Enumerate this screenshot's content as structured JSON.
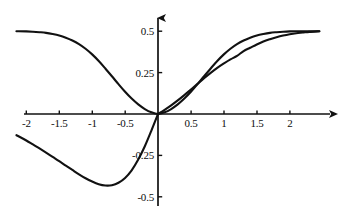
{
  "chart_data": {
    "type": "line",
    "title": "",
    "subtitle": "",
    "xlabel": "",
    "ylabel": "",
    "xlim": [
      -2.15,
      2.45
    ],
    "ylim": [
      -0.55,
      0.58
    ],
    "grid": false,
    "legend": "none",
    "background_color": "#ffffff",
    "line_color": "#111111",
    "axis_color": "#111111",
    "x_ticks": [
      {
        "value": -2,
        "label": "-2"
      },
      {
        "value": -1.5,
        "label": "-1.5"
      },
      {
        "value": -1,
        "label": "-1"
      },
      {
        "value": -0.5,
        "label": "-0.5"
      },
      {
        "value": 0.5,
        "label": "0.5"
      },
      {
        "value": 1,
        "label": "1"
      },
      {
        "value": 1.5,
        "label": "1.5"
      },
      {
        "value": 2,
        "label": "2"
      }
    ],
    "y_ticks": [
      {
        "value": 0.5,
        "label": "0.5"
      },
      {
        "value": 0.25,
        "label": "0.25"
      },
      {
        "value": -0.25,
        "label": "-0.25"
      },
      {
        "value": -0.5,
        "label": "-0.5"
      }
    ],
    "annotations": [
      {
        "name": "peak",
        "x": 0.72,
        "y": 0.43
      },
      {
        "name": "trough",
        "x": -0.72,
        "y": -0.43
      },
      {
        "name": "crossing",
        "x": 1.07,
        "y": 0.3
      },
      {
        "name": "origin",
        "x": 0,
        "y": 0
      }
    ],
    "series": [
      {
        "name": "decaying-bell-branch",
        "description": "Even bell-shaped curve at 0.5 on the far left, falling monotonically to 0 at the origin and decaying back toward 0 on the right.",
        "x": [
          -2.15,
          -2.0,
          -1.9,
          -1.8,
          -1.7,
          -1.6,
          -1.5,
          -1.4,
          -1.3,
          -1.2,
          -1.1,
          -1.0,
          -0.9,
          -0.8,
          -0.7,
          -0.6,
          -0.5,
          -0.4,
          -0.3,
          -0.2,
          -0.1,
          0.0,
          0.1,
          0.2,
          0.3,
          0.4,
          0.5,
          0.6,
          0.7,
          0.8,
          0.9,
          1.0,
          1.1,
          1.2,
          1.3,
          1.4,
          1.5,
          1.6,
          1.7,
          1.8,
          1.9,
          2.0,
          2.1,
          2.2,
          2.3,
          2.45
        ],
        "y": [
          0.5,
          0.499,
          0.497,
          0.494,
          0.49,
          0.483,
          0.474,
          0.461,
          0.444,
          0.422,
          0.394,
          0.36,
          0.32,
          0.275,
          0.228,
          0.18,
          0.134,
          0.093,
          0.058,
          0.03,
          0.01,
          0.0,
          0.01,
          0.03,
          0.058,
          0.093,
          0.134,
          0.18,
          0.228,
          0.275,
          0.32,
          0.36,
          0.394,
          0.422,
          0.444,
          0.461,
          0.474,
          0.483,
          0.49,
          0.494,
          0.497,
          0.499,
          0.5,
          0.5,
          0.5,
          0.5
        ]
      },
      {
        "name": "rising-sigmoid",
        "description": "Odd monotonic S-curve through the origin, saturating at +0.5 on the right.",
        "x": [
          0.0,
          0.1,
          0.2,
          0.3,
          0.4,
          0.5,
          0.6,
          0.7,
          0.8,
          0.9,
          1.0,
          1.1,
          1.2,
          1.3,
          1.4,
          1.5,
          1.6,
          1.7,
          1.8,
          1.9,
          2.0,
          2.1,
          2.2,
          2.3,
          2.45
        ],
        "y": [
          0.0,
          0.025,
          0.052,
          0.082,
          0.114,
          0.148,
          0.182,
          0.216,
          0.248,
          0.278,
          0.305,
          0.33,
          0.351,
          0.38,
          0.4,
          0.42,
          0.438,
          0.452,
          0.464,
          0.474,
          0.482,
          0.488,
          0.492,
          0.496,
          0.5
        ]
      },
      {
        "name": "negative-lobe",
        "description": "Odd companion branch on the left: dips to a minimum near x = -0.72 then returns to the origin.",
        "x": [
          -2.15,
          -2.0,
          -1.9,
          -1.8,
          -1.7,
          -1.6,
          -1.5,
          -1.4,
          -1.3,
          -1.2,
          -1.1,
          -1.0,
          -0.9,
          -0.8,
          -0.7,
          -0.6,
          -0.5,
          -0.4,
          -0.3,
          -0.2,
          -0.1,
          0.0
        ],
        "y": [
          -0.128,
          -0.16,
          -0.184,
          -0.208,
          -0.233,
          -0.259,
          -0.285,
          -0.312,
          -0.338,
          -0.364,
          -0.388,
          -0.408,
          -0.424,
          -0.432,
          -0.43,
          -0.415,
          -0.386,
          -0.34,
          -0.275,
          -0.195,
          -0.1,
          0.0
        ]
      }
    ]
  },
  "axes": {
    "x_axis_name": "horizontal-axis",
    "y_axis_name": "vertical-axis",
    "x_arrow": "right-arrowhead",
    "y_arrow": "up-arrowhead"
  }
}
